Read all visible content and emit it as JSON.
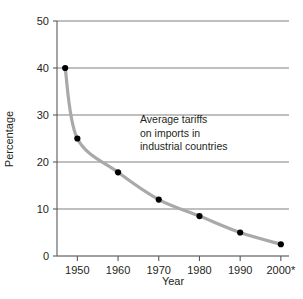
{
  "chart_data": {
    "type": "line",
    "title": "",
    "subtitle": "",
    "xlabel": "Year",
    "ylabel": "Percentage",
    "xlim": [
      1945,
      2002
    ],
    "ylim": [
      0,
      50
    ],
    "grid": "horizontal",
    "legend": "none",
    "annotations": [
      {
        "name": "series-annotation",
        "lines": [
          "Average tariffs",
          "on imports in",
          "industrial countries"
        ]
      }
    ],
    "x_tick_labels": [
      "1950",
      "1960",
      "1970",
      "1980",
      "1990",
      "2000*"
    ],
    "x_tick_values": [
      1950,
      1960,
      1970,
      1980,
      1990,
      2000
    ],
    "y_tick_labels": [
      "0",
      "10",
      "20",
      "30",
      "40",
      "50"
    ],
    "y_tick_values": [
      0,
      10,
      20,
      30,
      40,
      50
    ],
    "series": [
      {
        "name": "Average tariffs on imports in industrial countries",
        "line_color": "#a9a9a9",
        "marker_color": "#000000",
        "x": [
          1947,
          1950,
          1960,
          1970,
          1980,
          1990,
          2000
        ],
        "values": [
          40,
          25,
          17.8,
          12,
          8.5,
          5,
          2.5
        ]
      }
    ]
  },
  "axes": {
    "y_label": "Percentage",
    "x_label": "Year"
  },
  "footnote": {
    "marker": "*"
  },
  "colors": {
    "line": "#a9a9a9",
    "marker": "#000000",
    "grid": "#808080",
    "axis": "#58595b",
    "text": "#231f20",
    "background": "#ffffff"
  }
}
